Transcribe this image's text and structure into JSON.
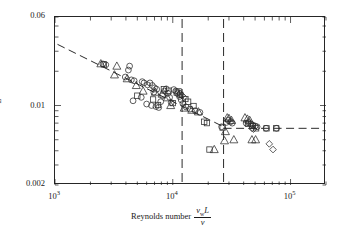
{
  "chart_data": {
    "type": "scatter",
    "title": "",
    "xlabel": "Reynolds number v_w L / nu",
    "ylabel": "A_s / L^2",
    "xscale": "log",
    "yscale": "log",
    "xlim": [
      1000,
      200000
    ],
    "ylim": [
      0.002,
      0.06
    ],
    "xticklabels": [
      "10³",
      "10⁴",
      "10⁵"
    ],
    "xtickvalues": [
      1000,
      10000,
      100000
    ],
    "yticklabels": [
      "0.06",
      "0.01",
      "0.002"
    ],
    "ytickvalues": [
      0.06,
      0.01,
      0.002
    ],
    "grid": false,
    "legend": false,
    "annotations": [
      {
        "text": "Stable",
        "x": 4000,
        "y": 0.043
      },
      {
        "text": "Transition",
        "x": 17000,
        "y": 0.043
      },
      {
        "text": "Turbulent",
        "x": 50000,
        "y": 0.043
      }
    ],
    "vertical_dividers": [
      12000,
      27000
    ],
    "trend_lines": [
      {
        "name": "stable-power-law",
        "style": "dashed",
        "points": [
          [
            1050,
            0.0345
          ],
          [
            27000,
            0.0065
          ]
        ]
      },
      {
        "name": "turbulent-plateau",
        "style": "dashed",
        "points": [
          [
            27000,
            0.0063
          ],
          [
            190000,
            0.0063
          ]
        ]
      }
    ],
    "series": [
      {
        "name": "circles",
        "marker": "circle",
        "points": [
          [
            2550,
            0.0232
          ],
          [
            2700,
            0.0228
          ],
          [
            4300,
            0.0222
          ],
          [
            4200,
            0.0205
          ],
          [
            3950,
            0.0178
          ],
          [
            4450,
            0.0168
          ],
          [
            4700,
            0.0165
          ],
          [
            5500,
            0.0162
          ],
          [
            5700,
            0.0158
          ],
          [
            6100,
            0.0152
          ],
          [
            6400,
            0.0158
          ],
          [
            6700,
            0.015
          ],
          [
            7000,
            0.0143
          ],
          [
            7300,
            0.0139
          ],
          [
            6900,
            0.0131
          ],
          [
            5400,
            0.0118
          ],
          [
            4600,
            0.011
          ],
          [
            6000,
            0.0103
          ],
          [
            6600,
            0.01
          ],
          [
            7200,
            0.0098
          ],
          [
            7600,
            0.0096
          ],
          [
            7900,
            0.0108
          ],
          [
            8200,
            0.0122
          ],
          [
            8500,
            0.0134
          ],
          [
            8800,
            0.014
          ],
          [
            9100,
            0.0128
          ],
          [
            9400,
            0.0118
          ],
          [
            9700,
            0.0106
          ],
          [
            10200,
            0.0138
          ],
          [
            10600,
            0.0134
          ],
          [
            11000,
            0.0127
          ],
          [
            11400,
            0.012
          ],
          [
            11800,
            0.0112
          ],
          [
            12200,
            0.0104
          ],
          [
            13000,
            0.0097
          ],
          [
            14000,
            0.0093
          ],
          [
            15500,
            0.009
          ],
          [
            17000,
            0.0087
          ],
          [
            26000,
            0.0065
          ],
          [
            28500,
            0.0071
          ],
          [
            29500,
            0.0074
          ],
          [
            31000,
            0.0072
          ],
          [
            32000,
            0.007
          ],
          [
            42000,
            0.007
          ],
          [
            44000,
            0.0071
          ],
          [
            46000,
            0.0069
          ],
          [
            48000,
            0.0067
          ],
          [
            50000,
            0.0066
          ],
          [
            52000,
            0.0065
          ],
          [
            62000,
            0.0063
          ],
          [
            76000,
            0.0063
          ]
        ]
      },
      {
        "name": "triangles",
        "marker": "triangle",
        "points": [
          [
            2450,
            0.0233
          ],
          [
            3350,
            0.0222
          ],
          [
            3200,
            0.0186
          ],
          [
            4100,
            0.0172
          ],
          [
            4900,
            0.015
          ],
          [
            5600,
            0.0134
          ],
          [
            7100,
            0.0131
          ],
          [
            8100,
            0.0126
          ],
          [
            9000,
            0.0117
          ],
          [
            9600,
            0.01
          ],
          [
            12500,
            0.0095
          ],
          [
            14500,
            0.0091
          ],
          [
            16500,
            0.0088
          ],
          [
            22500,
            0.0041
          ],
          [
            27500,
            0.0049
          ],
          [
            28000,
            0.0059
          ],
          [
            29000,
            0.0078
          ],
          [
            30000,
            0.0077
          ],
          [
            31500,
            0.0074
          ],
          [
            41000,
            0.0078
          ],
          [
            43000,
            0.0076
          ],
          [
            45000,
            0.0074
          ],
          [
            47000,
            0.005
          ],
          [
            50500,
            0.005
          ],
          [
            33000,
            0.005
          ]
        ]
      },
      {
        "name": "squares",
        "marker": "square",
        "points": [
          [
            2600,
            0.023
          ],
          [
            5000,
            0.0122
          ],
          [
            6800,
            0.0113
          ],
          [
            7500,
            0.0101
          ],
          [
            8400,
            0.0139
          ],
          [
            9200,
            0.0135
          ],
          [
            10000,
            0.0105
          ],
          [
            10800,
            0.013
          ],
          [
            11200,
            0.0133
          ],
          [
            11600,
            0.0124
          ],
          [
            12800,
            0.0114
          ],
          [
            13500,
            0.0108
          ],
          [
            15000,
            0.0099
          ],
          [
            18500,
            0.0072
          ],
          [
            19500,
            0.007
          ],
          [
            20500,
            0.0041
          ],
          [
            26500,
            0.0064
          ],
          [
            43500,
            0.0069
          ],
          [
            47500,
            0.0066
          ],
          [
            51000,
            0.0063
          ],
          [
            62500,
            0.0063
          ],
          [
            75500,
            0.0063
          ]
        ]
      },
      {
        "name": "diamonds",
        "marker": "diamond",
        "points": [
          [
            11500,
            0.0128
          ],
          [
            12000,
            0.0122
          ],
          [
            12400,
            0.0118
          ],
          [
            47000,
            0.0063
          ],
          [
            48500,
            0.0062
          ],
          [
            66000,
            0.0046
          ],
          [
            71000,
            0.0041
          ]
        ]
      }
    ]
  },
  "axes": {
    "y_title_numerator": "A",
    "y_title_numerator_sub": "s",
    "y_title_denominator": "L",
    "y_title_denominator_sup": "2",
    "x_title_prefix": "Reynolds number",
    "x_title_num_main": "v",
    "x_title_num_sub": "w",
    "x_title_num_tail": "L",
    "x_title_den": "ν",
    "y_top": "0.06",
    "y_mid": "0.01",
    "y_bot": "0.002",
    "x_tick_1": "10",
    "x_tick_1_exp": "3",
    "x_tick_2": "10",
    "x_tick_2_exp": "4",
    "x_tick_3": "10",
    "x_tick_3_exp": "5"
  },
  "regions": {
    "stable": "Stable",
    "transition": "Transition",
    "turbulent": "Turbulent"
  },
  "colors": {
    "ink": "#1a1a1a",
    "frame": "#262626",
    "marker": "#2a2a2a",
    "dash": "#2b2b2b",
    "background": "#ffffff"
  }
}
